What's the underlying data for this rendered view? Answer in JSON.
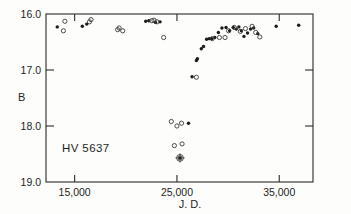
{
  "chart_data": {
    "type": "scatter",
    "title": "",
    "object_label": "HV 5637",
    "xlabel": "J. D.",
    "ylabel": "B",
    "xlim": [
      12200,
      38300
    ],
    "ylim": [
      19.0,
      16.0
    ],
    "y_inverted": true,
    "grid": false,
    "legend": "none",
    "xticks": [
      15000,
      25000,
      35000
    ],
    "xtick_labels": [
      "15,000",
      "25,000",
      "35,000"
    ],
    "yticks": [
      16.0,
      17.0,
      18.0,
      19.0
    ],
    "ytick_labels": [
      "16.0",
      "17.0",
      "18.0",
      "19.0"
    ],
    "series": [
      {
        "name": "filled",
        "marker": "filled-circle",
        "points": [
          [
            13300,
            16.23
          ],
          [
            15750,
            16.22
          ],
          [
            16180,
            16.18
          ],
          [
            21950,
            16.13
          ],
          [
            22250,
            16.12
          ],
          [
            22900,
            16.15
          ],
          [
            23350,
            16.14
          ],
          [
            26130,
            17.95
          ],
          [
            26480,
            17.12
          ],
          [
            26900,
            16.83
          ],
          [
            27000,
            16.8
          ],
          [
            27380,
            16.62
          ],
          [
            27600,
            16.58
          ],
          [
            27900,
            16.45
          ],
          [
            28150,
            16.44
          ],
          [
            28400,
            16.44
          ],
          [
            28700,
            16.42
          ],
          [
            29050,
            16.33
          ],
          [
            29400,
            16.25
          ],
          [
            29800,
            16.24
          ],
          [
            30150,
            16.3
          ],
          [
            30500,
            16.24
          ],
          [
            30800,
            16.27
          ],
          [
            31050,
            16.23
          ],
          [
            31300,
            16.3
          ],
          [
            31550,
            16.4
          ],
          [
            31900,
            16.34
          ],
          [
            32200,
            16.27
          ],
          [
            32500,
            16.25
          ],
          [
            32900,
            16.35
          ],
          [
            34700,
            16.22
          ],
          [
            36900,
            16.2
          ]
        ]
      },
      {
        "name": "open",
        "marker": "open-circle",
        "points": [
          [
            13900,
            16.3
          ],
          [
            14050,
            16.13
          ],
          [
            16450,
            16.14
          ],
          [
            16600,
            16.1
          ],
          [
            19200,
            16.28
          ],
          [
            19350,
            16.25
          ],
          [
            19700,
            16.3
          ],
          [
            22550,
            16.12
          ],
          [
            22750,
            16.11
          ],
          [
            23050,
            16.14
          ],
          [
            23700,
            16.42
          ],
          [
            24450,
            17.92
          ],
          [
            25000,
            18.0
          ],
          [
            25450,
            17.95
          ],
          [
            24750,
            18.35
          ],
          [
            25500,
            18.32
          ],
          [
            25300,
            18.57
          ],
          [
            26900,
            17.13
          ],
          [
            28450,
            16.44
          ],
          [
            29150,
            16.42
          ],
          [
            29700,
            16.42
          ],
          [
            30050,
            16.3
          ],
          [
            30600,
            16.24
          ],
          [
            31200,
            16.31
          ],
          [
            31700,
            16.26
          ],
          [
            32350,
            16.22
          ],
          [
            32700,
            16.33
          ],
          [
            33100,
            16.41
          ]
        ]
      },
      {
        "name": "uncertain",
        "marker": "circled-dot",
        "points": [
          [
            25300,
            18.57
          ]
        ]
      }
    ]
  },
  "axes": {
    "y_title": "B",
    "x_title": "J. D.",
    "object": "HV 5637"
  }
}
